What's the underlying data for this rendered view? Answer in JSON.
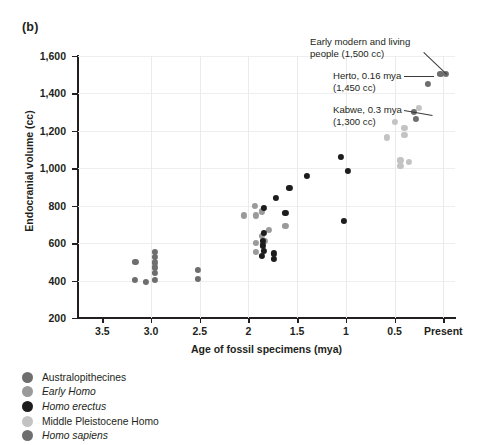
{
  "panel": {
    "label": "(b)"
  },
  "chart_data": {
    "type": "scatter",
    "title": "",
    "xlabel": "Age of fossil specimens (mya)",
    "ylabel": "Endocranial volume (cc)",
    "xlim": [
      3.75,
      -0.12
    ],
    "ylim": [
      200,
      1600
    ],
    "x_tick_values": [
      3.5,
      3.0,
      2.5,
      2.0,
      1.5,
      1.0,
      0.5,
      0.0
    ],
    "x_tick_labels": [
      "3.5",
      "3.0",
      "2.5",
      "2",
      "1.5",
      "1",
      "0.5",
      "Present"
    ],
    "y_tick_values": [
      200,
      400,
      600,
      800,
      1000,
      1200,
      1400,
      1600
    ],
    "y_tick_labels": [
      "200",
      "400",
      "600",
      "800",
      "1,000",
      "1,200",
      "1,400",
      "1,600"
    ],
    "grid": "both-light",
    "legend_position": "below-plot-left",
    "series": [
      {
        "name": "Australopithecines",
        "color": "#6e6e6e",
        "points": [
          {
            "x": 3.16,
            "y": 500
          },
          {
            "x": 3.17,
            "y": 405
          },
          {
            "x": 3.05,
            "y": 395
          },
          {
            "x": 2.96,
            "y": 555
          },
          {
            "x": 2.96,
            "y": 525
          },
          {
            "x": 2.96,
            "y": 497
          },
          {
            "x": 2.96,
            "y": 470
          },
          {
            "x": 2.96,
            "y": 440
          },
          {
            "x": 2.96,
            "y": 403
          },
          {
            "x": 2.52,
            "y": 455
          },
          {
            "x": 2.52,
            "y": 408
          }
        ]
      },
      {
        "name": "Early Homo",
        "color": "#9a9a9a",
        "points": [
          {
            "x": 2.05,
            "y": 748
          },
          {
            "x": 1.93,
            "y": 800
          },
          {
            "x": 1.92,
            "y": 748
          },
          {
            "x": 1.86,
            "y": 770
          },
          {
            "x": 1.86,
            "y": 640
          },
          {
            "x": 1.92,
            "y": 600
          },
          {
            "x": 1.92,
            "y": 555
          },
          {
            "x": 1.79,
            "y": 672
          },
          {
            "x": 1.62,
            "y": 690
          },
          {
            "x": 1.83,
            "y": 612
          }
        ]
      },
      {
        "name": "Homo erectus",
        "color": "#1d1d1d",
        "points": [
          {
            "x": 1.84,
            "y": 790
          },
          {
            "x": 1.84,
            "y": 655
          },
          {
            "x": 1.85,
            "y": 612
          },
          {
            "x": 1.85,
            "y": 588
          },
          {
            "x": 1.84,
            "y": 560
          },
          {
            "x": 1.86,
            "y": 533
          },
          {
            "x": 1.74,
            "y": 545
          },
          {
            "x": 1.74,
            "y": 515
          },
          {
            "x": 1.72,
            "y": 840
          },
          {
            "x": 1.62,
            "y": 760
          },
          {
            "x": 1.58,
            "y": 895
          },
          {
            "x": 1.4,
            "y": 960
          },
          {
            "x": 1.05,
            "y": 1060
          },
          {
            "x": 0.98,
            "y": 985
          },
          {
            "x": 1.02,
            "y": 720
          }
        ]
      },
      {
        "name": "Middle Pleistocene Homo",
        "color": "#c3c3c3",
        "points": [
          {
            "x": 0.58,
            "y": 1165
          },
          {
            "x": 0.5,
            "y": 1250
          },
          {
            "x": 0.4,
            "y": 1215
          },
          {
            "x": 0.4,
            "y": 1180
          },
          {
            "x": 0.44,
            "y": 1042
          },
          {
            "x": 0.44,
            "y": 1012
          },
          {
            "x": 0.35,
            "y": 1035
          },
          {
            "x": 0.25,
            "y": 1322
          }
        ]
      },
      {
        "name": "Homo sapiens",
        "color": "#6e6e6e",
        "points": [
          {
            "x": 0.3,
            "y": 1300
          },
          {
            "x": 0.28,
            "y": 1265
          },
          {
            "x": 0.16,
            "y": 1450
          },
          {
            "x": 0.03,
            "y": 1505
          },
          {
            "x": -0.03,
            "y": 1505
          }
        ]
      }
    ],
    "annotations": [
      {
        "name": "early-modern-living-people",
        "text": "Early modern and living\npeople (1,500 cc)"
      },
      {
        "name": "herto",
        "text": "Herto, 0.16 mya\n(1,450 cc)"
      },
      {
        "name": "kabwe",
        "text": "Kabwe, 0.3 mya\n(1,300 cc)"
      }
    ]
  },
  "legend": {
    "items": [
      {
        "label": "Australopithecines",
        "italic": false,
        "color": "#6e6e6e"
      },
      {
        "label": "Early Homo",
        "italic": true,
        "color": "#9a9a9a"
      },
      {
        "label": "Homo erectus",
        "italic": true,
        "color": "#1d1d1d"
      },
      {
        "label": "Middle Pleistocene Homo",
        "italic": false,
        "color": "#c3c3c3"
      },
      {
        "label": "Homo sapiens",
        "italic": true,
        "color": "#6e6e6e"
      }
    ]
  }
}
